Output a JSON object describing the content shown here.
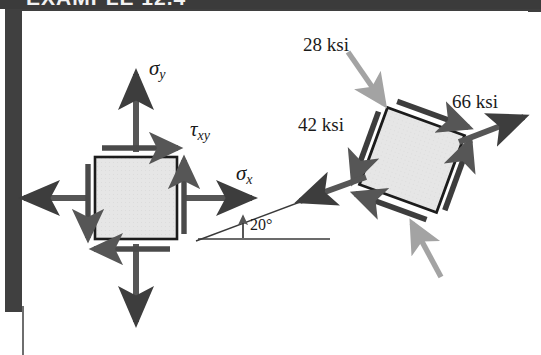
{
  "figure": {
    "title_partial": "EXAMPLE 12.4",
    "caption": "Plane stress element and its 20-degree rotated equivalent",
    "colors": {
      "arrow_dark": "#565656",
      "arrow_gray": "#a3a3a3",
      "square_fill": "#e6e6e6",
      "square_edge": "#1c1c1c",
      "border_bar": "#3b3b3b",
      "text": "#1a1a1a"
    }
  },
  "left_element": {
    "name": "original-stress-element",
    "labels": {
      "sigma_y": "σ",
      "sigma_y_sub": "y",
      "sigma_x": "σ",
      "sigma_x_sub": "x",
      "tau_xy": "τ",
      "tau_xy_sub": "xy"
    },
    "angle_label": "20°",
    "normal_arrows": [
      "up",
      "down",
      "left",
      "right"
    ],
    "shear_arrows": [
      "top-right",
      "bottom-left",
      "left-down",
      "right-up"
    ]
  },
  "right_element": {
    "name": "rotated-stress-element",
    "rotation_deg": 20,
    "labels": {
      "top": "28 ksi",
      "left": "42 ksi",
      "right": "66 ksi"
    },
    "pointer_arrows": [
      "top-incoming",
      "bottom-incoming"
    ],
    "normal_arrows": [
      "up-right",
      "down-left"
    ],
    "shear_arrows": [
      "top-edge",
      "right-edge",
      "bottom-edge",
      "left-edge"
    ]
  }
}
